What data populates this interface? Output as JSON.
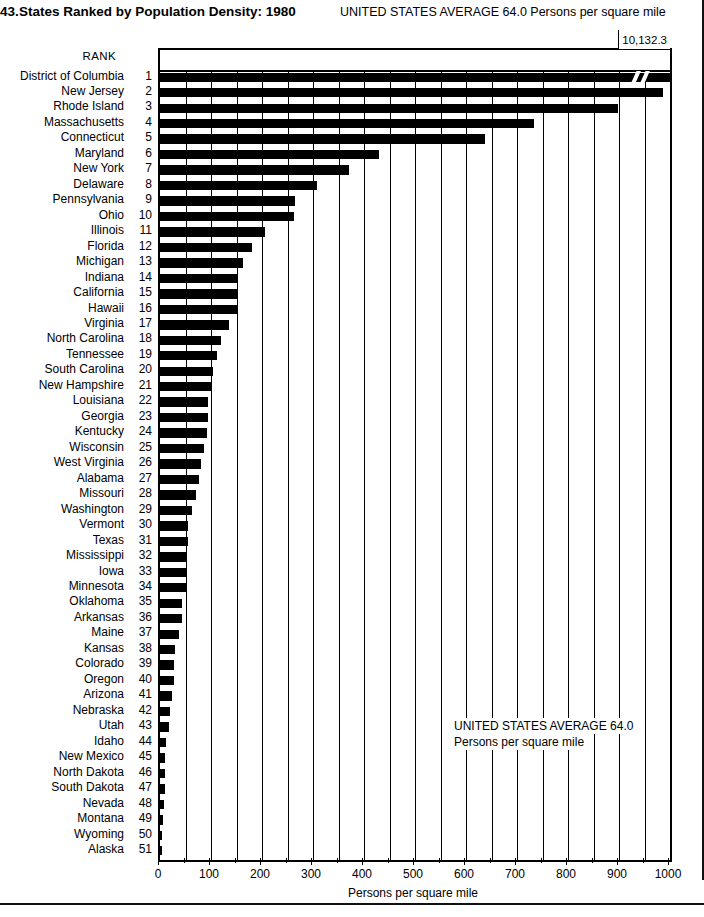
{
  "header": {
    "number": "43.",
    "title": "States Ranked by Population Density: 1980",
    "note": "UNITED STATES AVERAGE 64.0 Persons per square mile"
  },
  "axis": {
    "rank_header": "RANK",
    "x_title": "Persons per square mile",
    "ticks": [
      "0",
      "100",
      "200",
      "300",
      "400",
      "500",
      "600",
      "700",
      "800",
      "900",
      "1000"
    ]
  },
  "annotation": {
    "line1": "UNITED STATES AVERAGE 64.0",
    "line2": "Persons per square mile",
    "dc_value_label": "10,132.3"
  },
  "chart_data": {
    "type": "bar",
    "orientation": "horizontal",
    "title": "States Ranked by Population Density: 1980",
    "xlabel": "Persons per square mile",
    "ylabel": "",
    "xlim": [
      0,
      1000
    ],
    "grid": true,
    "legend": false,
    "note": "District of Columbia bar is broken; its true value is 10,132.3",
    "us_average": 64.0,
    "categories": [
      "District of Columbia",
      "New Jersey",
      "Rhode Island",
      "Massachusetts",
      "Connecticut",
      "Maryland",
      "New York",
      "Delaware",
      "Pennsylvania",
      "Ohio",
      "Illinois",
      "Florida",
      "Michigan",
      "Indiana",
      "California",
      "Hawaii",
      "Virginia",
      "North Carolina",
      "Tennessee",
      "South Carolina",
      "New Hampshire",
      "Louisiana",
      "Georgia",
      "Kentucky",
      "Wisconsin",
      "West Virginia",
      "Alabama",
      "Missouri",
      "Washington",
      "Vermont",
      "Texas",
      "Mississippi",
      "Iowa",
      "Minnesota",
      "Oklahoma",
      "Arkansas",
      "Maine",
      "Kansas",
      "Colorado",
      "Oregon",
      "Arizona",
      "Nebraska",
      "Utah",
      "Idaho",
      "New Mexico",
      "North Dakota",
      "South Dakota",
      "Nevada",
      "Montana",
      "Wyoming",
      "Alaska"
    ],
    "ranks": [
      1,
      2,
      3,
      4,
      5,
      6,
      7,
      8,
      9,
      10,
      11,
      12,
      13,
      14,
      15,
      16,
      17,
      18,
      19,
      20,
      21,
      22,
      23,
      24,
      25,
      26,
      27,
      28,
      29,
      30,
      31,
      32,
      33,
      34,
      35,
      36,
      37,
      38,
      39,
      40,
      41,
      42,
      43,
      44,
      45,
      46,
      47,
      48,
      49,
      50,
      51
    ],
    "values": [
      10132.3,
      986.2,
      897.8,
      733.3,
      637.8,
      428.7,
      370.6,
      307.6,
      264.3,
      263.3,
      205.3,
      180.0,
      162.6,
      152.8,
      151.4,
      150.1,
      134.7,
      120.4,
      111.6,
      103.4,
      102.4,
      94.5,
      94.1,
      92.3,
      86.5,
      80.8,
      76.6,
      71.3,
      62.1,
      55.2,
      54.3,
      53.4,
      52.1,
      51.2,
      44.1,
      43.9,
      36.3,
      28.9,
      27.9,
      27.4,
      23.9,
      20.5,
      17.8,
      11.5,
      10.7,
      9.4,
      8.9,
      7.3,
      5.4,
      4.8,
      0.7
    ]
  }
}
